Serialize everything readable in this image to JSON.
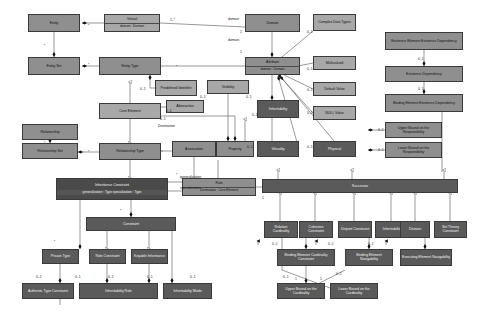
{
  "diagram": {
    "palette": {
      "light_fill": "#a8a8a8",
      "mid_fill": "#8f8f8f",
      "dark_fill": "#5a5a5a",
      "very_dark_fill": "#4a4a4a",
      "line": "#3a3a3a",
      "background": "#ffffff"
    },
    "nodes": [
      {
        "id": "entity",
        "label": "Entity",
        "compartment": "",
        "shade": "sh-mid",
        "x": 28,
        "y": 14,
        "w": 52,
        "h": 18
      },
      {
        "id": "virtual",
        "label": "Virtual",
        "compartment": "domain : Domain",
        "shade": "sh-light",
        "x": 104,
        "y": 14,
        "w": 56,
        "h": 18
      },
      {
        "id": "domain",
        "label": "Domain",
        "compartment": "",
        "shade": "sh-mid",
        "x": 245,
        "y": 14,
        "w": 55,
        "h": 18
      },
      {
        "id": "complex-data-types",
        "label": "Complex Data Types",
        "compartment": "",
        "shade": "sh-light",
        "x": 313,
        "y": 14,
        "w": 43,
        "h": 17
      },
      {
        "id": "existence-element-existence-dependency",
        "label": "Existence Element Existence Dependency",
        "compartment": "",
        "shade": "sh-mid",
        "x": 385,
        "y": 32,
        "w": 78,
        "h": 18
      },
      {
        "id": "entity-set",
        "label": "Entity Set",
        "compartment": "",
        "shade": "sh-mid",
        "x": 28,
        "y": 57,
        "w": 52,
        "h": 18
      },
      {
        "id": "entity-type",
        "label": "Entity Type",
        "compartment": "",
        "shade": "sh-mid",
        "x": 99,
        "y": 57,
        "w": 62,
        "h": 18
      },
      {
        "id": "attribute",
        "label": "Attribute",
        "compartment": "domain : Domain",
        "shade": "sh-mid",
        "x": 245,
        "y": 57,
        "w": 55,
        "h": 18
      },
      {
        "id": "multivalued",
        "label": "Multivalued",
        "compartment": "",
        "shade": "sh-light",
        "x": 313,
        "y": 56,
        "w": 43,
        "h": 14
      },
      {
        "id": "existence-dependency",
        "label": "Existence Dependency",
        "compartment": "",
        "shade": "sh-mid",
        "x": 385,
        "y": 66,
        "w": 78,
        "h": 16
      },
      {
        "id": "predefined-identifier",
        "label": "Predefined Identifier",
        "compartment": "",
        "shade": "sh-light",
        "x": 155,
        "y": 80,
        "w": 42,
        "h": 16
      },
      {
        "id": "visibility",
        "label": "Visibility",
        "compartment": "",
        "shade": "sh-light",
        "x": 207,
        "y": 80,
        "w": 42,
        "h": 14
      },
      {
        "id": "default-value",
        "label": "Default Value",
        "compartment": "",
        "shade": "sh-light",
        "x": 313,
        "y": 82,
        "w": 43,
        "h": 14
      },
      {
        "id": "binding-element-existence-dependency",
        "label": "Binding Element Existence Dependency",
        "compartment": "",
        "shade": "sh-mid",
        "x": 385,
        "y": 94,
        "w": 78,
        "h": 18
      },
      {
        "id": "core-element",
        "label": "Core Element",
        "compartment": "",
        "shade": "sh-light",
        "x": 99,
        "y": 103,
        "w": 62,
        "h": 16
      },
      {
        "id": "abstraction",
        "label": "Abstraction",
        "compartment": "",
        "shade": "sh-light",
        "x": 166,
        "y": 100,
        "w": 38,
        "h": 13
      },
      {
        "id": "inheritability-1",
        "label": "Inheritability",
        "compartment": "",
        "shade": "sh-dark",
        "x": 257,
        "y": 100,
        "w": 42,
        "h": 18
      },
      {
        "id": "null-value",
        "label": "NULL Value",
        "compartment": "",
        "shade": "sh-light",
        "x": 313,
        "y": 106,
        "w": 43,
        "h": 14
      },
      {
        "id": "upper-bound-responsibility",
        "label": "Upper Bound on the Responsibility",
        "compartment": "",
        "shade": "sh-mid",
        "x": 385,
        "y": 122,
        "w": 57,
        "h": 16
      },
      {
        "id": "relationship",
        "label": "Relationship",
        "compartment": "",
        "shade": "sh-mid",
        "x": 22,
        "y": 124,
        "w": 56,
        "h": 16
      },
      {
        "id": "lower-bound-responsibility",
        "label": "Lower Bound on the Responsibility",
        "compartment": "",
        "shade": "sh-mid",
        "x": 385,
        "y": 142,
        "w": 57,
        "h": 16
      },
      {
        "id": "relationship-set",
        "label": "Relationship Set",
        "compartment": "",
        "shade": "sh-mid",
        "x": 22,
        "y": 143,
        "w": 56,
        "h": 16
      },
      {
        "id": "relationship-type",
        "label": "Relationship Type",
        "compartment": "",
        "shade": "sh-mid",
        "x": 99,
        "y": 143,
        "w": 62,
        "h": 17
      },
      {
        "id": "association",
        "label": "Association",
        "compartment": "",
        "shade": "sh-mid",
        "x": 172,
        "y": 141,
        "w": 44,
        "h": 16
      },
      {
        "id": "property",
        "label": "Property",
        "compartment": "",
        "shade": "sh-mid",
        "x": 216,
        "y": 141,
        "w": 38,
        "h": 16
      },
      {
        "id": "virtuality",
        "label": "Virtuality",
        "compartment": "",
        "shade": "sh-dark",
        "x": 257,
        "y": 141,
        "w": 42,
        "h": 16
      },
      {
        "id": "physical",
        "label": "Physical",
        "compartment": "",
        "shade": "sh-dark",
        "x": 313,
        "y": 141,
        "w": 43,
        "h": 16
      },
      {
        "id": "inheritance-constraint",
        "label": "Inheritance Constraint",
        "compartment": "generalization : Type\nspecialization : Type",
        "shade": "sh-vdark",
        "x": 56,
        "y": 178,
        "w": 112,
        "h": 22
      },
      {
        "id": "rule",
        "label": "Rule",
        "compartment": "Destination : Core Element",
        "shade": "sh-mid",
        "x": 182,
        "y": 178,
        "w": 74,
        "h": 18
      },
      {
        "id": "successor",
        "label": "Successor",
        "compartment": "",
        "shade": "sh-dark",
        "x": 262,
        "y": 179,
        "w": 196,
        "h": 14
      },
      {
        "id": "constraint",
        "label": "Constraint",
        "compartment": "",
        "shade": "sh-dark",
        "x": 86,
        "y": 217,
        "w": 90,
        "h": 14
      },
      {
        "id": "relation-cardinality",
        "label": "Relation Cardinality",
        "compartment": "",
        "shade": "sh-dark",
        "x": 264,
        "y": 221,
        "w": 34,
        "h": 17
      },
      {
        "id": "cohesion-constraint",
        "label": "Cohesion Constraint",
        "compartment": "",
        "shade": "sh-dark",
        "x": 299,
        "y": 221,
        "w": 34,
        "h": 17
      },
      {
        "id": "disjoint-constraint",
        "label": "Disjoint Constraint",
        "compartment": "",
        "shade": "sh-dark",
        "x": 338,
        "y": 221,
        "w": 34,
        "h": 17
      },
      {
        "id": "inheritability-2",
        "label": "Inheritability",
        "compartment": "",
        "shade": "sh-dark",
        "x": 375,
        "y": 221,
        "w": 34,
        "h": 17
      },
      {
        "id": "division",
        "label": "Division",
        "compartment": "",
        "shade": "sh-dark",
        "x": 400,
        "y": 221,
        "w": 30,
        "h": 17
      },
      {
        "id": "set-theory-constraint",
        "label": "Set Theory Constraint",
        "compartment": "",
        "shade": "sh-dark",
        "x": 434,
        "y": 221,
        "w": 33,
        "h": 17
      },
      {
        "id": "private-type",
        "label": "Private Type",
        "compartment": "",
        "shade": "sh-dark",
        "x": 42,
        "y": 249,
        "w": 37,
        "h": 15
      },
      {
        "id": "role-constraint",
        "label": "Role Constraint",
        "compartment": "",
        "shade": "sh-dark",
        "x": 89,
        "y": 249,
        "w": 37,
        "h": 15
      },
      {
        "id": "keyable-inheritance",
        "label": "Keyable Inheritance",
        "compartment": "",
        "shade": "sh-dark",
        "x": 131,
        "y": 249,
        "w": 37,
        "h": 15
      },
      {
        "id": "binding-element-cardinality-constraint",
        "label": "Binding Element Cardinality Constraint",
        "compartment": "",
        "shade": "sh-dark",
        "x": 277,
        "y": 249,
        "w": 58,
        "h": 17
      },
      {
        "id": "authentic-type-constraint",
        "label": "Authentic Type Constraint",
        "compartment": "",
        "shade": "sh-dark",
        "x": 22,
        "y": 283,
        "w": 52,
        "h": 16
      },
      {
        "id": "inheritability-role",
        "label": "Inheritability Role",
        "compartment": "",
        "shade": "sh-dark",
        "x": 79,
        "y": 283,
        "w": 79,
        "h": 16
      },
      {
        "id": "inheritability-mode",
        "label": "Inheritability Mode",
        "compartment": "",
        "shade": "sh-dark",
        "x": 163,
        "y": 283,
        "w": 49,
        "h": 16
      },
      {
        "id": "upper-bound-cardinality",
        "label": "Upper Bound on the Cardinality",
        "compartment": "",
        "shade": "sh-dark",
        "x": 277,
        "y": 283,
        "w": 48,
        "h": 16
      },
      {
        "id": "lower-bound-cardinality",
        "label": "Lower Bound on the Cardinality",
        "compartment": "",
        "shade": "sh-dark",
        "x": 330,
        "y": 283,
        "w": 48,
        "h": 16
      },
      {
        "id": "binding-element-navigability",
        "label": "Binding Element Navigability",
        "compartment": "",
        "shade": "sh-dark",
        "x": 345,
        "y": 249,
        "w": 48,
        "h": 17
      },
      {
        "id": "executing-element-navigability",
        "label": "Executing Element Navigability",
        "compartment": "",
        "shade": "sh-dark",
        "x": 400,
        "y": 249,
        "w": 52,
        "h": 17
      }
    ],
    "multiplicities": [
      {
        "id": "m1",
        "text": "*",
        "x": 88,
        "y": 24
      },
      {
        "id": "m2",
        "text": "1..*",
        "x": 170,
        "y": 18
      },
      {
        "id": "m3",
        "text": "1",
        "x": 240,
        "y": 30
      },
      {
        "id": "m4",
        "text": "1",
        "x": 240,
        "y": 50
      },
      {
        "id": "m5",
        "text": "*",
        "x": 44,
        "y": 44
      },
      {
        "id": "m6",
        "text": "*",
        "x": 88,
        "y": 63
      },
      {
        "id": "m7",
        "text": "*",
        "x": 176,
        "y": 65
      },
      {
        "id": "m8",
        "text": "0..1",
        "x": 307,
        "y": 30
      },
      {
        "id": "m9",
        "text": "0..1",
        "x": 307,
        "y": 67
      },
      {
        "id": "m10",
        "text": "0..1",
        "x": 307,
        "y": 88
      },
      {
        "id": "m11",
        "text": "0..1",
        "x": 307,
        "y": 111
      },
      {
        "id": "m12",
        "text": "0..1",
        "x": 307,
        "y": 145
      },
      {
        "id": "m13",
        "text": "0..1",
        "x": 247,
        "y": 145
      },
      {
        "id": "m14",
        "text": "0..1",
        "x": 140,
        "y": 87
      },
      {
        "id": "m15",
        "text": "0..1",
        "x": 200,
        "y": 95
      },
      {
        "id": "m16",
        "text": "0..1",
        "x": 246,
        "y": 95
      },
      {
        "id": "m17",
        "text": "0..1",
        "x": 252,
        "y": 113
      },
      {
        "id": "m18",
        "text": "0..1",
        "x": 166,
        "y": 109
      },
      {
        "id": "m19",
        "text": "0..1",
        "x": 160,
        "y": 117
      },
      {
        "id": "m20",
        "text": "*",
        "x": 44,
        "y": 141
      },
      {
        "id": "m21",
        "text": "*",
        "x": 88,
        "y": 150
      },
      {
        "id": "m22",
        "text": "0..1",
        "x": 418,
        "y": 57
      },
      {
        "id": "m23",
        "text": "0..1",
        "x": 418,
        "y": 87
      },
      {
        "id": "m24",
        "text": "0..1",
        "x": 378,
        "y": 128
      },
      {
        "id": "m25",
        "text": "0..1",
        "x": 378,
        "y": 148
      },
      {
        "id": "m26",
        "text": "*",
        "x": 120,
        "y": 209
      },
      {
        "id": "m27",
        "text": "*",
        "x": 176,
        "y": 173
      },
      {
        "id": "m28",
        "text": "1",
        "x": 262,
        "y": 196
      },
      {
        "id": "m29",
        "text": "*",
        "x": 54,
        "y": 240
      },
      {
        "id": "m30",
        "text": "0..1",
        "x": 36,
        "y": 275
      },
      {
        "id": "m31",
        "text": "0..1",
        "x": 75,
        "y": 275
      },
      {
        "id": "m32",
        "text": "0..1",
        "x": 108,
        "y": 275
      },
      {
        "id": "m33",
        "text": "0..1",
        "x": 147,
        "y": 275
      },
      {
        "id": "m34",
        "text": "0..1",
        "x": 190,
        "y": 275
      },
      {
        "id": "m35",
        "text": "0..1",
        "x": 272,
        "y": 242
      },
      {
        "id": "m36",
        "text": "0..1",
        "x": 328,
        "y": 242
      },
      {
        "id": "m37",
        "text": "0..1",
        "x": 368,
        "y": 242
      },
      {
        "id": "m38",
        "text": "0..1",
        "x": 283,
        "y": 275
      },
      {
        "id": "m39",
        "text": "1",
        "x": 295,
        "y": 277
      },
      {
        "id": "m40",
        "text": "1",
        "x": 320,
        "y": 277
      },
      {
        "id": "m41",
        "text": "0..1",
        "x": 336,
        "y": 272
      }
    ],
    "edge_labels": [
      {
        "id": "e1",
        "text": "domain",
        "x": 228,
        "y": 17
      },
      {
        "id": "e2",
        "text": "domain",
        "x": 228,
        "y": 38
      },
      {
        "id": "e3",
        "text": "Destination",
        "x": 158,
        "y": 124
      },
      {
        "id": "e4",
        "text": "generalization",
        "x": 180,
        "y": 175
      },
      {
        "id": "e5",
        "text": "specialization",
        "x": 180,
        "y": 186
      }
    ]
  }
}
